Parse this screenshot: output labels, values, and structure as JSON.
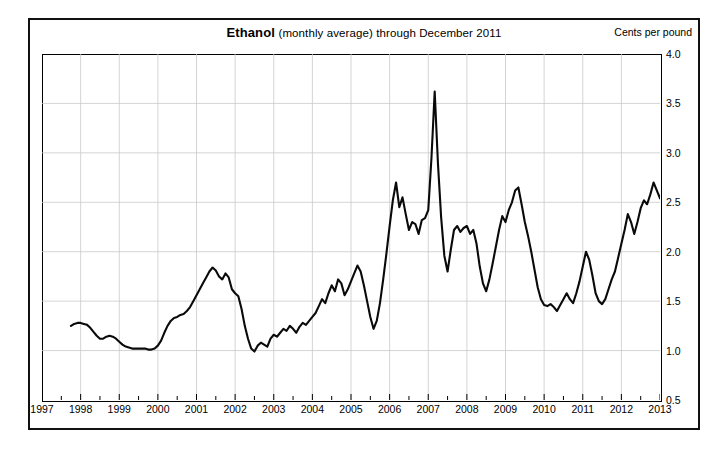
{
  "header": {
    "title_strong": "Ethanol",
    "title_light": "(monthly average) through December 2011",
    "unit_label": "Cents per pound"
  },
  "chart_data": {
    "type": "line",
    "title": "Ethanol (monthly average) through December 2011",
    "subtitle": "",
    "xlabel": "",
    "ylabel": "Cents per pound",
    "grid": true,
    "legend": "none",
    "xlim": [
      1997.0,
      2013.0
    ],
    "ylim": [
      0.5,
      4.0
    ],
    "ytick_labels": [
      "4.0",
      "3.5",
      "3.0",
      "2.5",
      "2.0",
      "1.5",
      "1.0",
      "0.5"
    ],
    "ytick_values": [
      4.0,
      3.5,
      3.0,
      2.5,
      2.0,
      1.5,
      1.0,
      0.5
    ],
    "xtick_labels": [
      "1997",
      "1998",
      "1999",
      "2000",
      "2001",
      "2002",
      "2003",
      "2004",
      "2005",
      "2006",
      "2007",
      "2008",
      "2009",
      "2010",
      "2011",
      "2012",
      "2013"
    ],
    "xtick_values": [
      1997,
      1998,
      1999,
      2000,
      2001,
      2002,
      2003,
      2004,
      2005,
      2006,
      2007,
      2008,
      2009,
      2010,
      2011,
      2012,
      2013
    ],
    "series": [
      {
        "name": "Ethanol monthly average",
        "color": "#0a0a0a",
        "x_start": 1997.75,
        "x_step": 0.0833333,
        "values": [
          1.25,
          1.27,
          1.28,
          1.28,
          1.27,
          1.26,
          1.23,
          1.19,
          1.15,
          1.12,
          1.12,
          1.14,
          1.15,
          1.14,
          1.12,
          1.09,
          1.06,
          1.04,
          1.03,
          1.02,
          1.02,
          1.02,
          1.02,
          1.02,
          1.01,
          1.01,
          1.02,
          1.05,
          1.1,
          1.18,
          1.25,
          1.3,
          1.33,
          1.34,
          1.36,
          1.37,
          1.4,
          1.44,
          1.5,
          1.56,
          1.62,
          1.68,
          1.74,
          1.8,
          1.84,
          1.81,
          1.75,
          1.72,
          1.78,
          1.74,
          1.62,
          1.58,
          1.55,
          1.42,
          1.25,
          1.12,
          1.02,
          0.99,
          1.05,
          1.08,
          1.06,
          1.04,
          1.12,
          1.16,
          1.14,
          1.18,
          1.22,
          1.2,
          1.25,
          1.22,
          1.18,
          1.24,
          1.28,
          1.26,
          1.3,
          1.34,
          1.38,
          1.45,
          1.52,
          1.48,
          1.58,
          1.66,
          1.6,
          1.72,
          1.68,
          1.56,
          1.62,
          1.7,
          1.78,
          1.86,
          1.8,
          1.66,
          1.5,
          1.34,
          1.22,
          1.3,
          1.48,
          1.72,
          1.98,
          2.26,
          2.52,
          2.7,
          2.45,
          2.55,
          2.38,
          2.22,
          2.3,
          2.28,
          2.18,
          2.32,
          2.34,
          2.42,
          2.95,
          3.62,
          2.9,
          2.35,
          1.96,
          1.8,
          2.02,
          2.22,
          2.26,
          2.2,
          2.24,
          2.26,
          2.18,
          2.22,
          2.08,
          1.85,
          1.68,
          1.6,
          1.72,
          1.88,
          2.05,
          2.22,
          2.36,
          2.3,
          2.42,
          2.5,
          2.62,
          2.65,
          2.48,
          2.3,
          2.16,
          2.0,
          1.82,
          1.64,
          1.52,
          1.46,
          1.45,
          1.47,
          1.44,
          1.4,
          1.46,
          1.52,
          1.58,
          1.52,
          1.48,
          1.58,
          1.7,
          1.85,
          2.0,
          1.92,
          1.76,
          1.58,
          1.5,
          1.47,
          1.52,
          1.62,
          1.72,
          1.8,
          1.94,
          2.08,
          2.22,
          2.38,
          2.3,
          2.18,
          2.3,
          2.44,
          2.52,
          2.48,
          2.58,
          2.7,
          2.62,
          2.54,
          2.66,
          2.8,
          2.85,
          2.7,
          2.55,
          2.33
        ]
      }
    ]
  }
}
